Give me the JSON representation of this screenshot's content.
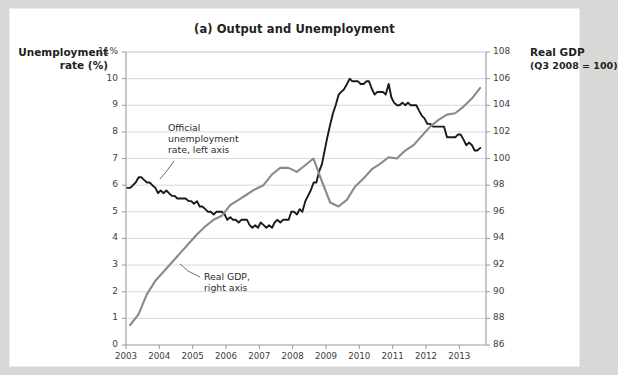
{
  "figure": {
    "title": "(a) Output and Unemployment",
    "left_axis_title_line1": "Unemployment",
    "left_axis_title_line2": "rate (%)",
    "right_axis_title_line1": "Real GDP",
    "right_axis_title_line2": "(Q3 2008 = 100)"
  },
  "annotations": {
    "unemployment": {
      "line1": "Official",
      "line2": "unemployment",
      "line3": "rate, left axis"
    },
    "gdp": {
      "line1": "Real GDP,",
      "line2": "right axis"
    }
  },
  "colors": {
    "unemployment_line": "#1a1a1a",
    "gdp_line": "#8a8a8a",
    "gridline": "#d9d9d9",
    "axis": "#9a9a9a",
    "text": "#231f20",
    "page_background": "#d8d8d6",
    "figure_background": "#ffffff"
  },
  "chart_data": {
    "type": "line",
    "title": "(a) Output and Unemployment",
    "xlabel": "",
    "ylabel": "Unemployment rate (%)",
    "y2label": "Real GDP (Q3 2008 = 100)",
    "xlim": [
      2003.0,
      2013.8
    ],
    "ylim": [
      0,
      11
    ],
    "y2lim": [
      86,
      108
    ],
    "grid": true,
    "legend": "annotations-inline",
    "xticks": [
      "2003",
      "2004",
      "2005",
      "2006",
      "2007",
      "2008",
      "2009",
      "2010",
      "2011",
      "2012",
      "2013"
    ],
    "xtick_values": [
      2003,
      2004,
      2005,
      2006,
      2007,
      2008,
      2009,
      2010,
      2011,
      2012,
      2013
    ],
    "yticks_left": [
      "0",
      "1",
      "2",
      "3",
      "4",
      "5",
      "6",
      "7",
      "8",
      "9",
      "10",
      "11%"
    ],
    "ytick_left_values": [
      0,
      1,
      2,
      3,
      4,
      5,
      6,
      7,
      8,
      9,
      10,
      11
    ],
    "yticks_right": [
      "86",
      "88",
      "90",
      "92",
      "94",
      "96",
      "98",
      "100",
      "102",
      "104",
      "106",
      "108"
    ],
    "ytick_right_values": [
      86,
      88,
      90,
      92,
      94,
      96,
      98,
      100,
      102,
      104,
      106,
      108
    ],
    "series": [
      {
        "name": "Official unemployment rate, left axis",
        "axis": "left",
        "color": "#1a1a1a",
        "units": "percent",
        "x": [
          2003.04,
          2003.13,
          2003.21,
          2003.29,
          2003.38,
          2003.46,
          2003.54,
          2003.63,
          2003.71,
          2003.79,
          2003.88,
          2003.96,
          2004.04,
          2004.13,
          2004.21,
          2004.29,
          2004.38,
          2004.46,
          2004.54,
          2004.63,
          2004.71,
          2004.79,
          2004.88,
          2004.96,
          2005.04,
          2005.13,
          2005.21,
          2005.29,
          2005.38,
          2005.46,
          2005.54,
          2005.63,
          2005.71,
          2005.79,
          2005.88,
          2005.96,
          2006.04,
          2006.13,
          2006.21,
          2006.29,
          2006.38,
          2006.46,
          2006.54,
          2006.63,
          2006.71,
          2006.79,
          2006.88,
          2006.96,
          2007.04,
          2007.13,
          2007.21,
          2007.29,
          2007.38,
          2007.46,
          2007.54,
          2007.63,
          2007.71,
          2007.79,
          2007.88,
          2007.96,
          2008.04,
          2008.13,
          2008.21,
          2008.29,
          2008.38,
          2008.46,
          2008.54,
          2008.63,
          2008.71,
          2008.79,
          2008.88,
          2008.96,
          2009.04,
          2009.13,
          2009.21,
          2009.29,
          2009.38,
          2009.46,
          2009.54,
          2009.63,
          2009.71,
          2009.79,
          2009.88,
          2009.96,
          2010.04,
          2010.13,
          2010.21,
          2010.29,
          2010.38,
          2010.46,
          2010.54,
          2010.63,
          2010.71,
          2010.79,
          2010.88,
          2010.96,
          2011.04,
          2011.13,
          2011.21,
          2011.29,
          2011.38,
          2011.46,
          2011.54,
          2011.63,
          2011.71,
          2011.79,
          2011.88,
          2011.96,
          2012.04,
          2012.13,
          2012.21,
          2012.29,
          2012.38,
          2012.46,
          2012.54,
          2012.63,
          2012.71,
          2012.79,
          2012.88,
          2012.96,
          2013.04,
          2013.13,
          2013.21,
          2013.29,
          2013.38,
          2013.46,
          2013.54,
          2013.63
        ],
        "values": [
          5.9,
          5.9,
          6.0,
          6.1,
          6.3,
          6.3,
          6.2,
          6.1,
          6.1,
          6.0,
          5.9,
          5.7,
          5.8,
          5.7,
          5.8,
          5.7,
          5.6,
          5.6,
          5.5,
          5.5,
          5.5,
          5.5,
          5.4,
          5.4,
          5.3,
          5.4,
          5.2,
          5.2,
          5.1,
          5.0,
          5.0,
          4.9,
          5.0,
          5.0,
          5.0,
          4.9,
          4.7,
          4.8,
          4.7,
          4.7,
          4.6,
          4.7,
          4.7,
          4.7,
          4.5,
          4.4,
          4.5,
          4.4,
          4.6,
          4.5,
          4.4,
          4.5,
          4.4,
          4.6,
          4.7,
          4.6,
          4.7,
          4.7,
          4.7,
          5.0,
          5.0,
          4.9,
          5.1,
          5.0,
          5.4,
          5.6,
          5.8,
          6.1,
          6.1,
          6.5,
          6.8,
          7.3,
          7.8,
          8.3,
          8.7,
          9.0,
          9.4,
          9.5,
          9.6,
          9.8,
          10.0,
          9.9,
          9.9,
          9.9,
          9.8,
          9.8,
          9.9,
          9.9,
          9.6,
          9.4,
          9.5,
          9.5,
          9.5,
          9.4,
          9.8,
          9.3,
          9.1,
          9.0,
          9.0,
          9.1,
          9.0,
          9.1,
          9.0,
          9.0,
          9.0,
          8.8,
          8.6,
          8.5,
          8.3,
          8.3,
          8.2,
          8.2,
          8.2,
          8.2,
          8.2,
          7.8,
          7.8,
          7.8,
          7.8,
          7.9,
          7.9,
          7.7,
          7.5,
          7.6,
          7.5,
          7.3,
          7.3,
          7.4
        ]
      },
      {
        "name": "Real GDP, right axis",
        "axis": "right",
        "color": "#8a8a8a",
        "units": "index, Q3 2008 = 100",
        "x": [
          2003.125,
          2003.375,
          2003.625,
          2003.875,
          2004.125,
          2004.375,
          2004.625,
          2004.875,
          2005.125,
          2005.375,
          2005.625,
          2005.875,
          2006.125,
          2006.375,
          2006.625,
          2006.875,
          2007.125,
          2007.375,
          2007.625,
          2007.875,
          2008.125,
          2008.375,
          2008.625,
          2008.875,
          2009.125,
          2009.375,
          2009.625,
          2009.875,
          2010.125,
          2010.375,
          2010.625,
          2010.875,
          2011.125,
          2011.375,
          2011.625,
          2011.875,
          2012.125,
          2012.375,
          2012.625,
          2012.875,
          2013.125,
          2013.375,
          2013.625
        ],
        "values": [
          87.5,
          88.3,
          89.8,
          90.8,
          91.5,
          92.2,
          92.9,
          93.6,
          94.3,
          94.9,
          95.4,
          95.7,
          96.5,
          96.9,
          97.3,
          97.7,
          98.0,
          98.8,
          99.3,
          99.3,
          99.0,
          99.5,
          100.0,
          98.3,
          96.7,
          96.4,
          96.9,
          97.9,
          98.5,
          99.2,
          99.6,
          100.1,
          100.0,
          100.6,
          101.0,
          101.7,
          102.4,
          102.9,
          103.3,
          103.4,
          103.9,
          104.5,
          105.3
        ]
      }
    ]
  }
}
